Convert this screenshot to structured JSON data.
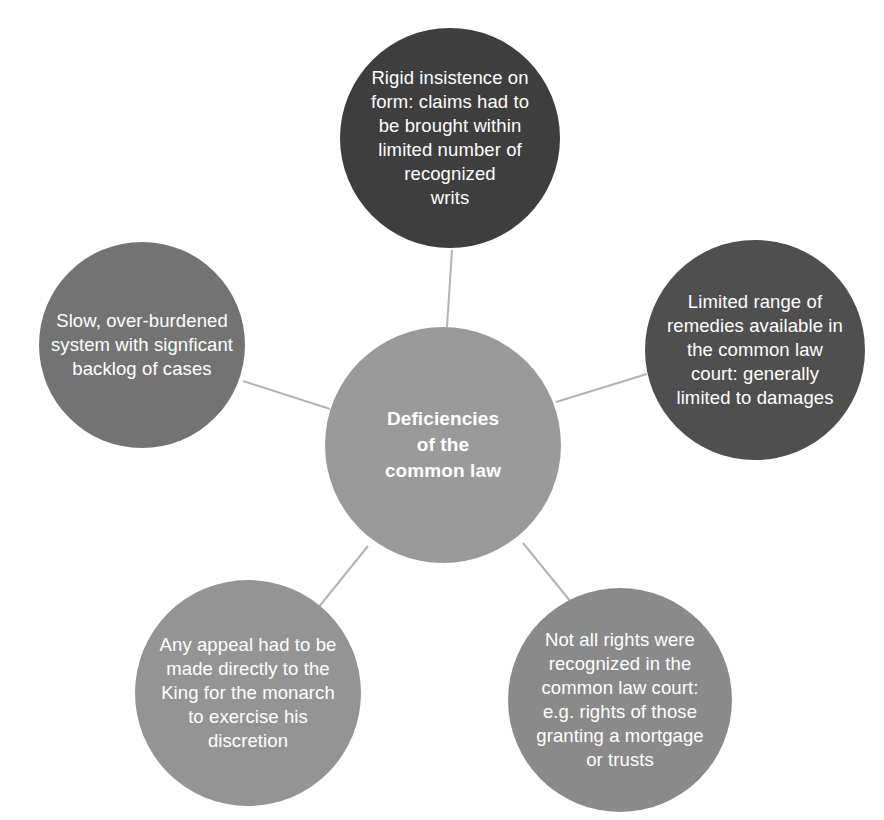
{
  "diagram": {
    "title": "Deficiencies of the common law",
    "type": "hub-and-spoke-circle-diagram",
    "background_color": "#ffffff",
    "connector_color": "#b3b3b3",
    "text_color": "#ffffff",
    "center": {
      "id": "center",
      "label": "Deficiencies\nof the\ncommon law",
      "color": "#9a9a9a",
      "bold": true
    },
    "nodes": [
      {
        "id": "top",
        "position": "top",
        "label": "Rigid insistence on\nform: claims had to\nbe brought within\nlimited number of\nrecognized\nwrits",
        "color": "#3e3e3e"
      },
      {
        "id": "right",
        "position": "right",
        "label": "Limited range of\nremedies available in\nthe common law\ncourt: generally\nlimited to damages",
        "color": "#4f4f4f"
      },
      {
        "id": "bottom-right",
        "position": "bottom-right",
        "label": "Not all rights were\nrecognized in the\ncommon law court:\ne.g. rights of those\ngranting a mortgage\nor trusts",
        "color": "#8a8a8a"
      },
      {
        "id": "bottom-left",
        "position": "bottom-left",
        "label": "Any appeal had to be\nmade directly to the\nKing for the monarch\nto exercise his\ndiscretion",
        "color": "#949494"
      },
      {
        "id": "left",
        "position": "left",
        "label": "Slow, over-burdened\nsystem with signficant\nbacklog of cases",
        "color": "#737373"
      }
    ],
    "connectors": [
      {
        "id": "center-to-top",
        "from": "center",
        "to": "top"
      },
      {
        "id": "center-to-right",
        "from": "center",
        "to": "right"
      },
      {
        "id": "center-to-bottom-right",
        "from": "center",
        "to": "bottom-right"
      },
      {
        "id": "center-to-bottom-left",
        "from": "center",
        "to": "bottom-left"
      },
      {
        "id": "center-to-left",
        "from": "center",
        "to": "left"
      }
    ]
  }
}
